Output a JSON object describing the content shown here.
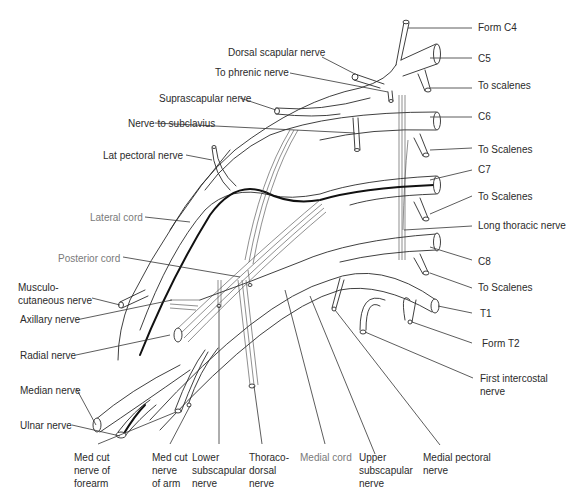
{
  "diagram": {
    "labels": {
      "form_c4": "Form C4",
      "c5": "C5",
      "to_scalenes_1": "To scalenes",
      "c6": "C6",
      "to_scalenes_2": "To Scalenes",
      "c7": "C7",
      "to_scalenes_3": "To Scalenes",
      "long_thoracic": "Long thoracic nerve",
      "c8": "C8",
      "to_scalenes_4": "To Scalenes",
      "t1": "T1",
      "form_t2": "Form T2",
      "first_intercostal": "First intercostal\nnerve",
      "medial_pectoral": "Medial pectoral\nnerve",
      "upper_subscapular": "Upper\nsubscapular\nnerve",
      "medial_cord": "Medial cord",
      "thoracodorsal": "Thoraco-\ndorsal\nnerve",
      "lower_subscapular": "Lower\nsubscapular\nnerve",
      "med_cut_arm": "Med cut\nnerve\nof arm",
      "med_cut_forearm": "Med cut\nnerve of\nforearm",
      "ulnar": "Ulnar nerve",
      "median": "Median nerve",
      "radial": "Radial nerve",
      "axillary": "Axillary nerve",
      "musculocutaneous": "Musculo-\ncutaneous nerve",
      "posterior_cord": "Posterior cord",
      "lateral_cord": "Lateral cord",
      "lat_pectoral": "Lat pectoral nerve",
      "nerve_subclavius": "Nerve to subclavius",
      "suprascapular": "Suprascapular nerve",
      "to_phrenic": "To phrenic nerve",
      "dorsal_scapular": "Dorsal scapular nerve"
    },
    "colors": {
      "line": "#2a2a2a",
      "label": "#2b2b2b",
      "cord_label": "#7a7a7a"
    }
  }
}
